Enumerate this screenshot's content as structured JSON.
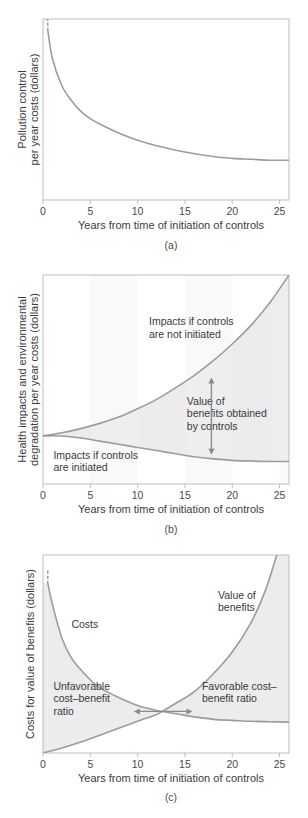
{
  "chart_data": [
    {
      "id": "a",
      "type": "line",
      "panel_label": "(a)",
      "title": "",
      "xlabel": "Years from time of initiation of controls",
      "ylabel_lines": [
        "Pollution control",
        "per year costs (dollars)"
      ],
      "xlim": [
        0,
        26
      ],
      "xticks": [
        0,
        5,
        10,
        15,
        20,
        25
      ],
      "ylim": [
        0,
        100
      ],
      "yticks": [],
      "grid": false,
      "series": [
        {
          "name": "Pollution control costs",
          "x": [
            0.5,
            1,
            2,
            3,
            4,
            5,
            6,
            8,
            10,
            12,
            15,
            18,
            20,
            22,
            24,
            26
          ],
          "y": [
            94,
            78,
            63,
            55,
            49,
            45,
            42,
            37,
            33,
            30,
            26.5,
            24,
            23,
            22.5,
            22,
            22
          ],
          "dashed_start": true
        }
      ]
    },
    {
      "id": "b",
      "type": "area",
      "panel_label": "(b)",
      "title": "",
      "xlabel": "Years from time of initiation of controls",
      "ylabel_lines": [
        "Health impacts and environmental",
        "degradation per year costs (dollars)"
      ],
      "xlim": [
        0,
        26
      ],
      "xticks": [
        0,
        5,
        10,
        15,
        20,
        25
      ],
      "ylim": [
        0,
        100
      ],
      "yticks": [],
      "grid": false,
      "series": [
        {
          "name": "Impacts if controls are not initiated",
          "x": [
            0,
            2,
            4,
            6,
            8,
            10,
            12,
            14,
            16,
            18,
            20,
            22,
            24,
            26
          ],
          "y": [
            23,
            24.5,
            26.5,
            29,
            32,
            36,
            40.5,
            46,
            52,
            59,
            67,
            76,
            87,
            100
          ]
        },
        {
          "name": "Impacts if controls are initiated",
          "x": [
            0,
            2,
            4,
            6,
            8,
            10,
            12,
            14,
            16,
            18,
            20,
            22,
            24,
            26
          ],
          "y": [
            23,
            23,
            22,
            20.5,
            19,
            17.5,
            16,
            14.5,
            13,
            12,
            11.3,
            11,
            10.8,
            10.8
          ]
        }
      ],
      "annotations": [
        {
          "text_lines": [
            "Impacts if controls",
            "are not initiated"
          ],
          "x": 11.2,
          "y": 76
        },
        {
          "text_lines": [
            "Value of",
            "benefits obtained",
            "by controls"
          ],
          "x": 15.2,
          "y": 38
        },
        {
          "text_lines": [
            "Impacts if controls",
            "are initiated"
          ],
          "x": 1.1,
          "y": 12
        },
        {
          "type": "double-arrow-vertical",
          "x": 17.8,
          "y_from": 51,
          "y_to": 14
        }
      ],
      "fill_between": "benefits region shaded light gray"
    },
    {
      "id": "c",
      "type": "line",
      "panel_label": "(c)",
      "title": "",
      "xlabel": "Years from time of initiation of controls",
      "ylabel_lines": [
        "Costs for value of benefits (dollars)"
      ],
      "xlim": [
        0,
        26
      ],
      "xticks": [
        0,
        5,
        10,
        15,
        20,
        25
      ],
      "ylim": [
        0,
        100
      ],
      "yticks": [],
      "grid": false,
      "series": [
        {
          "name": "Costs",
          "x": [
            0.5,
            1,
            2,
            3,
            4,
            5,
            6,
            8,
            10,
            12,
            12.6,
            15,
            18,
            20,
            22,
            24,
            26
          ],
          "y": [
            86,
            75,
            58,
            48,
            42,
            37,
            33,
            28,
            24,
            21.5,
            21,
            19,
            17,
            16.5,
            16,
            15.8,
            15.6
          ],
          "dashed_start": true
        },
        {
          "name": "Value of benefits",
          "x": [
            0,
            2,
            4,
            6,
            8,
            10,
            12,
            12.6,
            14,
            16,
            18,
            20,
            22,
            23.5,
            24.7
          ],
          "y": [
            0,
            2.5,
            5.5,
            9,
            12.5,
            16,
            19.5,
            21,
            25,
            31,
            40,
            51,
            66,
            82,
            100
          ]
        }
      ],
      "annotations": [
        {
          "text_lines": [
            "Costs"
          ],
          "x": 3.0,
          "y": 63
        },
        {
          "text_lines": [
            "Value of",
            "benefits"
          ],
          "x": 18.5,
          "y": 78
        },
        {
          "text_lines": [
            "Unfavorable",
            "cost–benefit",
            "ratio"
          ],
          "x": 1.1,
          "y": 32
        },
        {
          "text_lines": [
            "Favorable cost–",
            "benefit ratio"
          ],
          "x": 16.8,
          "y": 32
        },
        {
          "type": "double-arrow-horizontal",
          "y": 21,
          "x_from": 9.6,
          "x_to": 15.8
        }
      ],
      "crossover_year": 12.6
    }
  ]
}
